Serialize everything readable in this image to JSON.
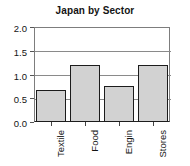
{
  "chart_data": {
    "type": "bar",
    "title": "Japan by Sector",
    "xlabel": "",
    "ylabel": "",
    "categories": [
      "Textile",
      "Food",
      "Engin",
      "Stores"
    ],
    "values": [
      0.67,
      1.2,
      0.75,
      1.2
    ],
    "ylim": [
      0.0,
      2.0
    ],
    "ytick_labels": [
      "0.0",
      "0.5",
      "1.0",
      "1.5",
      "2.0"
    ],
    "ytick_values": [
      0.0,
      0.5,
      1.0,
      1.5,
      2.0
    ],
    "grid": "horizontal",
    "legend": "none",
    "bar_fill_color": "#d2d2d2",
    "bar_edge_color": "#1c1c1c",
    "axis_color": "#7d7d7d",
    "gridline_color": "#8a8a8a",
    "background_color": "#ffffff",
    "xtick_label_rotation": 90
  }
}
